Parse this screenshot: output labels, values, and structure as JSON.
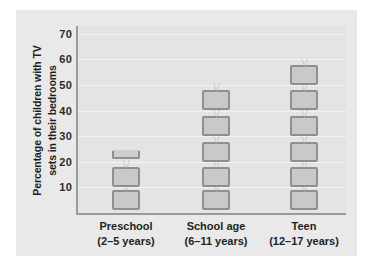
{
  "chart_data": {
    "type": "bar",
    "title": "",
    "subtitle": "",
    "xlabel": "",
    "ylabel_line1": "Percentage of children with TV",
    "ylabel_line2": "sets in their bedrooms",
    "categories": [
      "Preschool",
      "School age",
      "Teen"
    ],
    "category_sublabels": [
      "(2–5 years)",
      "(6–11 years)",
      "(12–17 years)"
    ],
    "values": [
      23,
      45,
      55
    ],
    "ylim": [
      0,
      73
    ],
    "yticks": [
      10,
      20,
      30,
      40,
      50,
      60,
      70
    ],
    "ytick_labels": [
      "10",
      "20",
      "30",
      "40",
      "50",
      "60",
      "70"
    ],
    "grid": true,
    "legend": "none",
    "pictograph": {
      "icon": "tv-icon",
      "icon_value": 10,
      "icons": [
        [
          {
            "type": "full",
            "value": 5
          },
          {
            "type": "full",
            "value": 14
          },
          {
            "type": "half",
            "value": 23
          }
        ],
        [
          {
            "type": "full",
            "value": 5
          },
          {
            "type": "full",
            "value": 14
          },
          {
            "type": "full",
            "value": 24
          },
          {
            "type": "full",
            "value": 34
          },
          {
            "type": "full",
            "value": 44
          }
        ],
        [
          {
            "type": "full",
            "value": 5
          },
          {
            "type": "full",
            "value": 14
          },
          {
            "type": "full",
            "value": 24
          },
          {
            "type": "full",
            "value": 34
          },
          {
            "type": "full",
            "value": 44
          },
          {
            "type": "full",
            "value": 54
          }
        ]
      ]
    },
    "colors": {
      "page_background": "#ffffff",
      "plate_background": "#e9e9e9",
      "plot_background": "#e4e4e4",
      "gridline": "#f4f4f4",
      "axis_line": "#9a9a9a",
      "icon_border": "#8f8f8f",
      "icon_fill": "#c9c9c9",
      "text": "#1f1f1f"
    }
  }
}
